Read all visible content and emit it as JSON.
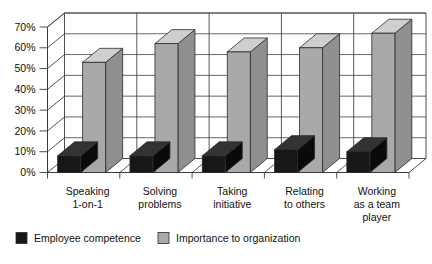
{
  "chart_data": {
    "type": "bar",
    "title": "",
    "subtitle": "",
    "xlabel": "",
    "ylabel": "",
    "ylim": [
      0,
      70
    ],
    "ytick_labels": [
      "0%",
      "10%",
      "20%",
      "30%",
      "40%",
      "50%",
      "60%",
      "70%"
    ],
    "ytick_values": [
      0,
      10,
      20,
      30,
      40,
      50,
      60,
      70
    ],
    "grid": true,
    "style": "3d-clustered-column",
    "legend_position": "bottom-left",
    "categories": [
      "Speaking\n1-on-1",
      "Solving\nproblems",
      "Taking\ninitiative",
      "Relating\nto others",
      "Working\nas a team\nplayer"
    ],
    "category_lines": [
      [
        "Speaking",
        "1-on-1"
      ],
      [
        "Solving",
        "problems"
      ],
      [
        "Taking",
        "initiative"
      ],
      [
        "Relating",
        "to others"
      ],
      [
        "Working",
        "as a team",
        "player"
      ]
    ],
    "series": [
      {
        "name": "Employee competence",
        "color": "#171717",
        "values": [
          8,
          8,
          8,
          11,
          10
        ]
      },
      {
        "name": "Importance to organization",
        "color": "#a9a9a9",
        "values": [
          53,
          62,
          58,
          60,
          67
        ]
      }
    ]
  },
  "legend": {
    "items": [
      {
        "label": "Employee competence",
        "swatch": "#171717"
      },
      {
        "label": "Importance to organization",
        "swatch": "#a9a9a9"
      }
    ]
  },
  "colors": {
    "plot_background": "#ffffff",
    "axis_line": "#3a3a3a",
    "gridline": "#4a4a4a",
    "bar_dark_front": "#171717",
    "bar_dark_top": "#333333",
    "bar_dark_side": "#0a0a0a",
    "bar_light_front": "#a9a9a9",
    "bar_light_top": "#cfcfcf",
    "bar_light_side": "#8f8f8f"
  }
}
